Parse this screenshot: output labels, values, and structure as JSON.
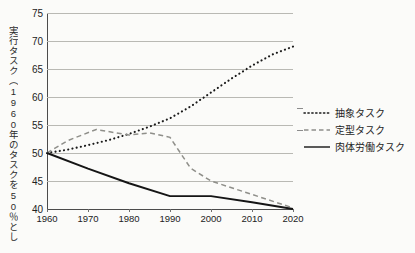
{
  "chart_data": {
    "type": "line",
    "title": "",
    "xlabel": "",
    "ylabel": "実行タスク（1960年のタスクを50％としたとき）",
    "x": [
      1960,
      1970,
      1980,
      1990,
      2000,
      2010,
      2020
    ],
    "xlim": [
      1960,
      2020
    ],
    "ylim": [
      40,
      75
    ],
    "yticks": [
      75,
      70,
      65,
      60,
      55,
      50,
      45,
      40
    ],
    "xticks": [
      "1960",
      "1970",
      "1980",
      "1990",
      "2000",
      "2010",
      "2020"
    ],
    "grid": true,
    "legend_position": "right",
    "series": [
      {
        "name": "抽象タスク",
        "style": "dotted",
        "color": "#1a1a1a",
        "x": [
          1960,
          1965,
          1970,
          1975,
          1980,
          1985,
          1990,
          1995,
          2000,
          2005,
          2010,
          2015,
          2020
        ],
        "values": [
          50.0,
          50.6,
          51.4,
          52.3,
          53.4,
          54.7,
          56.2,
          58.3,
          60.8,
          63.3,
          65.6,
          67.6,
          69.0
        ]
      },
      {
        "name": "定型タスク",
        "style": "dashed",
        "color": "#8f8f8a",
        "x": [
          1960,
          1965,
          1972,
          1980,
          1985,
          1990,
          1995,
          2000,
          2010,
          2020
        ],
        "values": [
          50.0,
          52.2,
          54.2,
          53.2,
          53.6,
          52.8,
          47.3,
          45.0,
          42.6,
          40.2
        ]
      },
      {
        "name": "肉体労働タスク",
        "style": "solid",
        "color": "#151515",
        "x": [
          1960,
          1970,
          1980,
          1990,
          2000,
          2010,
          2020
        ],
        "values": [
          50.0,
          47.2,
          44.6,
          42.3,
          42.3,
          41.2,
          40.0
        ]
      }
    ]
  },
  "legend": {
    "items": [
      {
        "label": "抽象タスク",
        "style": "dotted"
      },
      {
        "label": "定型タスク",
        "style": "dashed"
      },
      {
        "label": "肉体労働タスク",
        "style": "solid"
      }
    ]
  }
}
